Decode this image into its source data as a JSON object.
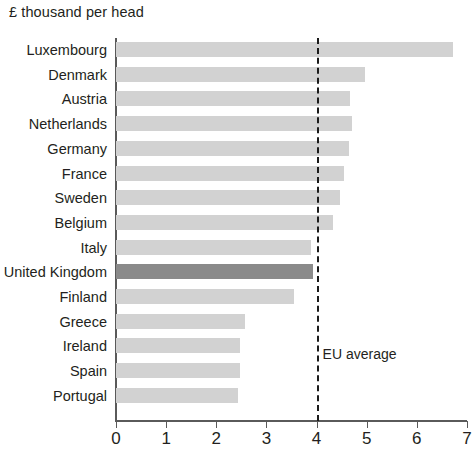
{
  "chart_data": {
    "type": "bar",
    "orientation": "horizontal",
    "title": "£ thousand per head",
    "xlabel": "",
    "ylabel": "",
    "xlim": [
      0,
      7
    ],
    "xticks": [
      0,
      1,
      2,
      3,
      4,
      5,
      6,
      7
    ],
    "xtick_labels": [
      "0",
      "1",
      "2",
      "3",
      "4",
      "5",
      "6",
      "7"
    ],
    "grid": false,
    "legend": null,
    "categories": [
      "Luxembourg",
      "Denmark",
      "Austria",
      "Netherlands",
      "Germany",
      "France",
      "Sweden",
      "Belgium",
      "Italy",
      "United Kingdom",
      "Finland",
      "Greece",
      "Ireland",
      "Spain",
      "Portugal"
    ],
    "values": [
      6.73,
      4.97,
      4.67,
      4.71,
      4.65,
      4.55,
      4.47,
      4.33,
      3.88,
      3.92,
      3.55,
      2.57,
      2.47,
      2.47,
      2.43
    ],
    "highlight_category": "United Kingdom",
    "bar_color": "#d2d2d2",
    "highlight_bar_color": "#8a8a8a",
    "annotations": [
      {
        "name": "eu-average",
        "label": "EU average",
        "value": 4.0,
        "style": "dashed-vertical-line",
        "color": "#1a1a1a",
        "label_x": 4.12,
        "label_y_px": 346
      }
    ]
  }
}
